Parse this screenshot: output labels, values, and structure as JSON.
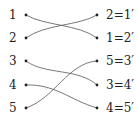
{
  "diagram": {
    "left_labels": [
      "1",
      "2",
      "3",
      "4",
      "5"
    ],
    "right_labels": [
      "2=1′",
      "1=2′",
      "5=3′",
      "3=4′",
      "4=5′"
    ],
    "connections": [
      {
        "from": "1",
        "to": "1=2′"
      },
      {
        "from": "2",
        "to": "2=1′"
      },
      {
        "from": "3",
        "to": "3=4′"
      },
      {
        "from": "4",
        "to": "4=5′"
      },
      {
        "from": "5",
        "to": "5=3′"
      }
    ]
  }
}
